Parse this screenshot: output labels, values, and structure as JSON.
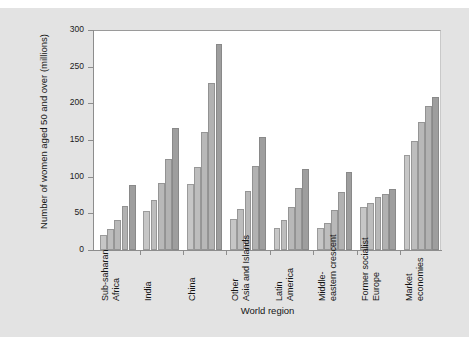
{
  "figure": {
    "background_color": "#e3e3e3",
    "plot_background_color": "#ffffff"
  },
  "chart_data": {
    "type": "bar",
    "title": "",
    "subtitle": "",
    "xlabel": "World region",
    "ylabel": "Number of women aged 50 and over (millions)",
    "ylim": [
      0,
      300
    ],
    "yticks": [
      0,
      50,
      100,
      150,
      200,
      250,
      300
    ],
    "ytick_labels": [
      "0",
      "50",
      "100",
      "150",
      "200",
      "250",
      "300"
    ],
    "grid": false,
    "legend": "none",
    "bar_colors": [
      "#c6c6c6",
      "#bdbdbd",
      "#b8b8b8",
      "#b2b2b2",
      "#9e9e9e"
    ],
    "categories": [
      "Sub-saharan Africa",
      "India",
      "China",
      "Other Asia and Islands",
      "Latin America",
      "Middle-eastern crescent",
      "Former socialist Europe",
      "Market economies"
    ],
    "category_lines": [
      [
        "Sub-saharan",
        "Africa"
      ],
      [
        "India",
        ""
      ],
      [
        "China",
        ""
      ],
      [
        "Other",
        "Asia and Islands"
      ],
      [
        "Latin",
        "America"
      ],
      [
        "Middle-",
        "eastern crescent"
      ],
      [
        "Former socialist",
        "Europe"
      ],
      [
        "Market",
        "economies"
      ]
    ],
    "series": [
      {
        "name": "bar-1",
        "values": [
          21,
          53,
          90,
          42,
          30,
          30,
          59,
          130
        ]
      },
      {
        "name": "bar-2",
        "values": [
          28,
          68,
          113,
          56,
          41,
          37,
          64,
          149
        ]
      },
      {
        "name": "bar-3",
        "values": [
          41,
          92,
          161,
          81,
          59,
          55,
          72,
          174
        ]
      },
      {
        "name": "bar-4",
        "values": [
          60,
          124,
          228,
          115,
          85,
          79,
          76,
          196
        ]
      },
      {
        "name": "bar-5",
        "values": [
          88,
          167,
          281,
          154,
          111,
          107,
          83,
          208
        ]
      }
    ],
    "groups": [
      {
        "category": "Sub-saharan Africa",
        "values": [
          21,
          28,
          41,
          60,
          88
        ]
      },
      {
        "category": "India",
        "values": [
          53,
          68,
          92,
          124,
          167
        ]
      },
      {
        "category": "China",
        "values": [
          90,
          113,
          161,
          228,
          281
        ]
      },
      {
        "category": "Other Asia and Islands",
        "values": [
          42,
          56,
          81,
          115,
          154
        ]
      },
      {
        "category": "Latin America",
        "values": [
          30,
          41,
          59,
          85,
          111
        ]
      },
      {
        "category": "Middle-eastern crescent",
        "values": [
          30,
          37,
          55,
          79,
          107
        ]
      },
      {
        "category": "Former socialist Europe",
        "values": [
          59,
          64,
          72,
          76,
          83
        ]
      },
      {
        "category": "Market economies",
        "values": [
          130,
          149,
          174,
          196,
          208
        ]
      }
    ]
  }
}
